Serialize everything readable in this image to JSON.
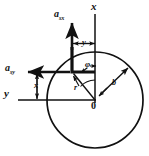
{
  "figure": {
    "type": "mechanics-vector-diagram",
    "background_color": "#ffffff",
    "stroke_color": "#111111",
    "labels": {
      "axis_x": {
        "base": "x",
        "sub": ""
      },
      "axis_y": {
        "base": "y",
        "sub": ""
      },
      "vector_asx": {
        "base": "a",
        "sub": "sx"
      },
      "vector_asy": {
        "base": "a",
        "sub": "sy"
      },
      "dim_x": {
        "base": "x",
        "sub": ""
      },
      "dim_y": {
        "base": "y",
        "sub": ""
      },
      "radius_r": {
        "base": "r",
        "sub": ""
      },
      "radius_b": {
        "base": "b",
        "sub": ""
      },
      "angle_phi": "φ",
      "origin": "0"
    },
    "geometry": {
      "circle_center": {
        "x": 95,
        "y": 100
      },
      "circle_radius": 48,
      "point": {
        "x": 72,
        "y": 72
      },
      "axis_x_label_pos": {
        "x": 94,
        "y": 5
      },
      "axis_y_label_pos": {
        "x": 6,
        "y": 93
      },
      "origin_label_pos": {
        "x": 92,
        "y": 102
      }
    }
  }
}
